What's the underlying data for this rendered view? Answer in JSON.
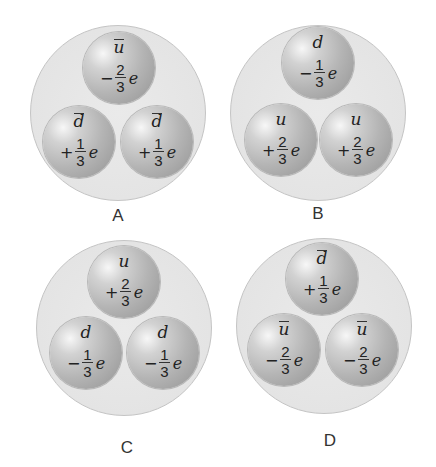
{
  "diagram": {
    "type": "hadron-quark-composition",
    "panels": [
      {
        "label": "A",
        "quarks": [
          {
            "symbol": "u",
            "antiparticle": true,
            "sign": "−",
            "numerator": "2",
            "denominator": "3",
            "unit": "e"
          },
          {
            "symbol": "d",
            "antiparticle": true,
            "sign": "+",
            "numerator": "1",
            "denominator": "3",
            "unit": "e"
          },
          {
            "symbol": "d",
            "antiparticle": true,
            "sign": "+",
            "numerator": "1",
            "denominator": "3",
            "unit": "e"
          }
        ]
      },
      {
        "label": "B",
        "quarks": [
          {
            "symbol": "d",
            "antiparticle": false,
            "sign": "−",
            "numerator": "1",
            "denominator": "3",
            "unit": "e"
          },
          {
            "symbol": "u",
            "antiparticle": false,
            "sign": "+",
            "numerator": "2",
            "denominator": "3",
            "unit": "e"
          },
          {
            "symbol": "u",
            "antiparticle": false,
            "sign": "+",
            "numerator": "2",
            "denominator": "3",
            "unit": "e"
          }
        ]
      },
      {
        "label": "C",
        "quarks": [
          {
            "symbol": "u",
            "antiparticle": false,
            "sign": "+",
            "numerator": "2",
            "denominator": "3",
            "unit": "e"
          },
          {
            "symbol": "d",
            "antiparticle": false,
            "sign": "−",
            "numerator": "1",
            "denominator": "3",
            "unit": "e"
          },
          {
            "symbol": "d",
            "antiparticle": false,
            "sign": "−",
            "numerator": "1",
            "denominator": "3",
            "unit": "e"
          }
        ]
      },
      {
        "label": "D",
        "quarks": [
          {
            "symbol": "d",
            "antiparticle": true,
            "sign": "+",
            "numerator": "1",
            "denominator": "3",
            "unit": "e"
          },
          {
            "symbol": "u",
            "antiparticle": true,
            "sign": "−",
            "numerator": "2",
            "denominator": "3",
            "unit": "e"
          },
          {
            "symbol": "u",
            "antiparticle": true,
            "sign": "−",
            "numerator": "2",
            "denominator": "3",
            "unit": "e"
          }
        ]
      }
    ]
  },
  "colors": {
    "background": "#ffffff",
    "hadron_fill": "#e6e6e6",
    "quark_fill": "#aaaaaa",
    "text": "#222222"
  }
}
